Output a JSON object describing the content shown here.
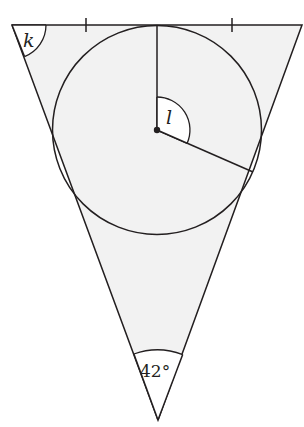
{
  "diagram": {
    "type": "geometry",
    "colors": {
      "fill": "#f2f2f2",
      "stroke": "#231f20",
      "background": "#ffffff"
    },
    "triangle": {
      "vertices": {
        "top_left": [
          12,
          25
        ],
        "top_right": [
          302,
          25
        ],
        "bottom": [
          158,
          420
        ]
      },
      "apex_angle_label": "42°",
      "top_left_angle_label": "k",
      "equal_tick_marks": 2
    },
    "circle": {
      "center": [
        157,
        130
      ],
      "radius": 104
    },
    "radii": [
      {
        "from": [
          157,
          130
        ],
        "to": [
          157,
          25
        ]
      },
      {
        "from": [
          157,
          130
        ],
        "to": [
          253,
          172
        ]
      }
    ],
    "center_angle_label": "l",
    "labels": {
      "k": "k",
      "l": "l",
      "apex": "42°"
    }
  }
}
